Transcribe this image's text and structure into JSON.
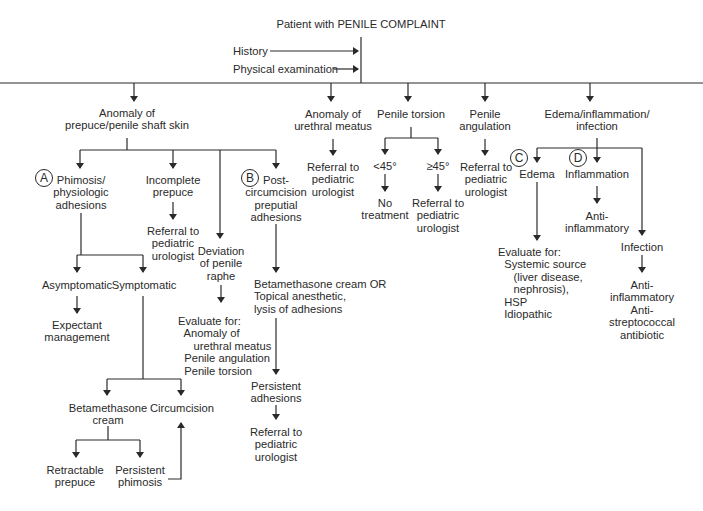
{
  "diagram": {
    "title": "Patient with PENILE COMPLAINT",
    "inputs": [
      "History",
      "Physical examination"
    ],
    "branches": {
      "prepuce": {
        "label": "Anomaly of\nprepuce/penile shaft skin",
        "children": {
          "phimosis": {
            "badge": "A",
            "label": "Phimosis/\nphysiologic\nadhesions",
            "asymptomatic": "Asymptomatic",
            "symptomatic": "Symptomatic",
            "expectant": "Expectant\nmanagement",
            "betamethasone": "Betamethasone\ncream",
            "circumcision": "Circumcision",
            "retractable": "Retractable\nprepuce",
            "persistent": "Persistent\nphimosis"
          },
          "incomplete": {
            "label": "Incomplete\nprepuce",
            "referral": "Referral to\npediatric\nurologist"
          },
          "raphe": {
            "label": "Deviation\nof penile\nraphe",
            "evaluate": "Evaluate for:\n  Anomaly of\n     urethral meatus\n  Penile angulation\n  Penile torsion"
          },
          "postcirc": {
            "badge": "B",
            "label": "Post-\ncircumcision\npreputial\nadhesions",
            "treatment": "Betamethasone cream OR\nTopical anesthetic,\nlysis of adhesions",
            "persistent": "Persistent\nadhesions",
            "referral": "Referral to\npediatric\nurologist"
          }
        }
      },
      "meatus": {
        "label": "Anomaly of\nurethral meatus",
        "referral": "Referral to\npediatric\nurologist"
      },
      "torsion": {
        "label": "Penile torsion",
        "lt45": "<45°",
        "ge45": "≥45°",
        "no_treatment": "No\ntreatment",
        "referral": "Referral to\npediatric\nurologist"
      },
      "angulation": {
        "label": "Penile\nangulation",
        "referral": "Referral to\npediatric\nurologist"
      },
      "edema_group": {
        "label": "Edema/inflammation/\ninfection",
        "edema": {
          "badge": "C",
          "label": "Edema",
          "evaluate": "Evaluate for:\n  Systemic source\n     (liver disease,\n     nephrosis),\n  HSP\n  Idiopathic"
        },
        "inflammation": {
          "badge": "D",
          "label": "Inflammation",
          "treatment": "Anti-\ninflammatory"
        },
        "infection": {
          "label": "Infection",
          "treatment": "Anti-\ninflammatory\nAnti-\nstreptococcal\nantibiotic"
        }
      }
    }
  },
  "colors": {
    "ink": "#2a2a2a",
    "background": "#ffffff"
  }
}
